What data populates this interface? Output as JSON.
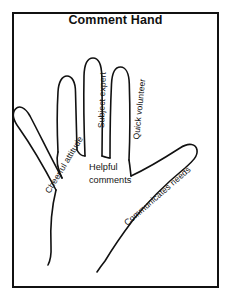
{
  "poster": {
    "title": "Comment Hand",
    "background_color": "#ffffff",
    "ink_color": "#111111",
    "border_color": "#111111"
  },
  "diagram": {
    "palm_text": "Helpful\ncomments",
    "labels": {
      "thumb": "Cheerful attitude",
      "index": "",
      "middle": "Subject expert",
      "ring": "Quick volunteer",
      "pinky": "Communicates needs"
    }
  }
}
